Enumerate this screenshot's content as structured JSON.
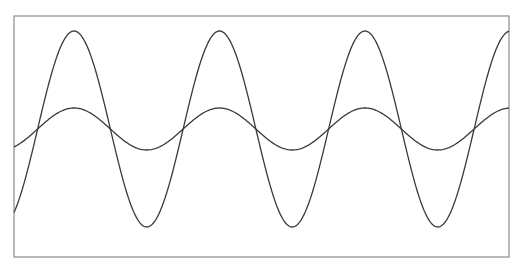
{
  "chart_data": {
    "type": "line",
    "title": "",
    "xlabel": "",
    "ylabel": "",
    "grid": false,
    "legend": null,
    "axis_ticks": "none",
    "frame_px": {
      "left": 14,
      "top": 16,
      "right": 509,
      "bottom": 257
    },
    "x_range_px": [
      14,
      509
    ],
    "series": [
      {
        "name": "large-amplitude sine",
        "kind": "sine",
        "period_px": 145.5,
        "first_peak_x_px": 74,
        "peak_y_px": 31,
        "trough_y_px": 227,
        "peaks_x_px": [
          74,
          219,
          365,
          509
        ],
        "troughs_x_px": [
          147,
          292,
          438
        ],
        "color": "#3a3a3a"
      },
      {
        "name": "small-amplitude sine",
        "kind": "sine",
        "period_px": 145.5,
        "first_peak_x_px": 74,
        "peak_y_px": 108,
        "trough_y_px": 150,
        "peaks_x_px": [
          74,
          219,
          365,
          509
        ],
        "troughs_x_px": [
          147,
          292,
          438
        ],
        "color": "#3a3a3a"
      }
    ],
    "relative_amplitude": {
      "large": 1.0,
      "small": 0.21
    }
  }
}
